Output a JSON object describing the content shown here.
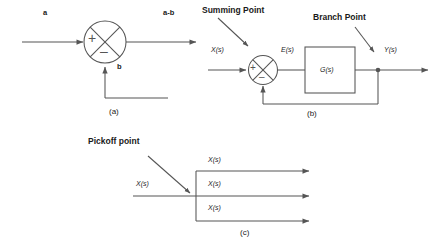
{
  "figure": {
    "line_color": "#555555",
    "text_color": "#1a1a1a"
  },
  "diagram_a": {
    "caption": "(a)",
    "input_label": "a",
    "output_label": "a-b",
    "feedback_label": "b",
    "summing_plus": "+",
    "summing_minus": "–"
  },
  "diagram_b": {
    "caption": "(b)",
    "summing_point_callout": "Summing Point",
    "branch_point_callout": "Branch Point",
    "input_label": "X(s)",
    "error_label": "E(s)",
    "output_label": "Y(s)",
    "block_label": "G(s)",
    "summing_plus": "+",
    "summing_minus": "–"
  },
  "diagram_c": {
    "caption": "(c)",
    "pickoff_callout": "Pickoff point",
    "input_label": "X(s)",
    "branch_labels": [
      "X(s)",
      "X(s)",
      "X(s)"
    ]
  }
}
